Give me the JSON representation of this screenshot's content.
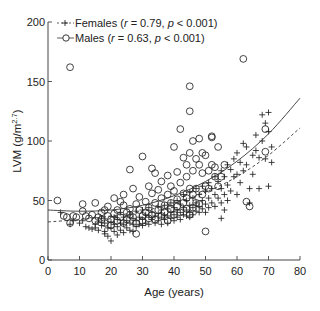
{
  "chart_data": {
    "type": "scatter",
    "title": "",
    "xlabel": "Age (years)",
    "ylabel": "LVM (g/m^2.7)",
    "ylabel_main": "LVM (g/m",
    "ylabel_sup": "2.7",
    "ylabel_end": ")",
    "xlim": [
      0,
      80
    ],
    "ylim": [
      0,
      200
    ],
    "xticks": [
      0,
      10,
      20,
      30,
      40,
      50,
      60,
      70,
      80
    ],
    "yticks": [
      0,
      50,
      100,
      150,
      200
    ],
    "grid": false,
    "legend_position": "top-left",
    "series": [
      {
        "name": "Females",
        "legend_label": "Females (r = 0.79, p < 0.001)",
        "marker": "plus",
        "line": "dashed",
        "r": "0.79",
        "p": "< 0.001",
        "fit_curve": {
          "x": [
            0,
            10,
            20,
            30,
            40,
            50,
            60,
            70,
            80
          ],
          "y": [
            32,
            34,
            37,
            41,
            48,
            57,
            70,
            88,
            111
          ]
        },
        "points": [
          [
            4,
            40
          ],
          [
            7,
            30
          ],
          [
            8,
            33
          ],
          [
            10,
            31
          ],
          [
            11,
            33
          ],
          [
            12,
            28
          ],
          [
            13,
            27
          ],
          [
            14,
            26
          ],
          [
            15,
            30
          ],
          [
            15,
            27
          ],
          [
            16,
            32
          ],
          [
            16,
            25
          ],
          [
            17,
            35
          ],
          [
            17,
            29
          ],
          [
            18,
            31
          ],
          [
            18,
            24
          ],
          [
            18,
            22
          ],
          [
            19,
            27
          ],
          [
            19,
            20
          ],
          [
            20,
            32
          ],
          [
            20,
            16
          ],
          [
            20,
            27
          ],
          [
            21,
            36
          ],
          [
            21,
            30
          ],
          [
            21,
            24
          ],
          [
            22,
            34
          ],
          [
            22,
            28
          ],
          [
            22,
            21
          ],
          [
            23,
            40
          ],
          [
            23,
            31
          ],
          [
            23,
            25
          ],
          [
            24,
            36
          ],
          [
            24,
            30
          ],
          [
            24,
            23
          ],
          [
            25,
            33
          ],
          [
            25,
            27
          ],
          [
            26,
            38
          ],
          [
            26,
            31
          ],
          [
            26,
            25
          ],
          [
            27,
            35
          ],
          [
            27,
            30
          ],
          [
            27,
            24
          ],
          [
            28,
            41
          ],
          [
            28,
            33
          ],
          [
            28,
            28
          ],
          [
            29,
            36
          ],
          [
            29,
            30
          ],
          [
            30,
            42
          ],
          [
            30,
            34
          ],
          [
            30,
            29
          ],
          [
            31,
            38
          ],
          [
            31,
            31
          ],
          [
            32,
            44
          ],
          [
            32,
            36
          ],
          [
            32,
            30
          ],
          [
            33,
            40
          ],
          [
            33,
            34
          ],
          [
            34,
            37
          ],
          [
            34,
            31
          ],
          [
            35,
            45
          ],
          [
            35,
            39
          ],
          [
            35,
            33
          ],
          [
            36,
            42
          ],
          [
            36,
            36
          ],
          [
            36,
            30
          ],
          [
            37,
            46
          ],
          [
            37,
            38
          ],
          [
            37,
            34
          ],
          [
            38,
            43
          ],
          [
            38,
            37
          ],
          [
            38,
            31
          ],
          [
            39,
            48
          ],
          [
            39,
            40
          ],
          [
            39,
            35
          ],
          [
            40,
            44
          ],
          [
            40,
            38
          ],
          [
            40,
            33
          ],
          [
            41,
            50
          ],
          [
            41,
            42
          ],
          [
            41,
            36
          ],
          [
            42,
            47
          ],
          [
            42,
            40
          ],
          [
            42,
            34
          ],
          [
            43,
            55
          ],
          [
            43,
            44
          ],
          [
            43,
            38
          ],
          [
            44,
            50
          ],
          [
            44,
            42
          ],
          [
            44,
            37
          ],
          [
            45,
            57
          ],
          [
            45,
            46
          ],
          [
            45,
            40
          ],
          [
            45,
            36
          ],
          [
            46,
            52
          ],
          [
            46,
            44
          ],
          [
            46,
            38
          ],
          [
            47,
            60
          ],
          [
            47,
            48
          ],
          [
            47,
            41
          ],
          [
            48,
            55
          ],
          [
            48,
            45
          ],
          [
            48,
            40
          ],
          [
            49,
            62
          ],
          [
            49,
            50
          ],
          [
            49,
            43
          ],
          [
            50,
            58
          ],
          [
            50,
            47
          ],
          [
            50,
            40
          ],
          [
            51,
            65
          ],
          [
            51,
            52
          ],
          [
            51,
            44
          ],
          [
            52,
            60
          ],
          [
            52,
            48
          ],
          [
            53,
            70
          ],
          [
            53,
            55
          ],
          [
            53,
            45
          ],
          [
            54,
            66
          ],
          [
            54,
            52
          ],
          [
            55,
            75
          ],
          [
            55,
            60
          ],
          [
            55,
            48
          ],
          [
            55,
            35
          ],
          [
            56,
            70
          ],
          [
            56,
            55
          ],
          [
            56,
            42
          ],
          [
            57,
            80
          ],
          [
            57,
            63
          ],
          [
            57,
            50
          ],
          [
            58,
            76
          ],
          [
            58,
            58
          ],
          [
            59,
            85
          ],
          [
            59,
            70
          ],
          [
            60,
            90
          ],
          [
            60,
            72
          ],
          [
            60,
            55
          ],
          [
            61,
            82
          ],
          [
            61,
            65
          ],
          [
            62,
            98
          ],
          [
            62,
            75
          ],
          [
            63,
            95
          ],
          [
            63,
            80
          ],
          [
            64,
            60
          ],
          [
            64,
            48
          ],
          [
            65,
            88
          ],
          [
            65,
            72
          ],
          [
            66,
            105
          ],
          [
            66,
            92
          ],
          [
            67,
            86
          ],
          [
            67,
            60
          ],
          [
            68,
            122
          ],
          [
            68,
            100
          ],
          [
            69,
            115
          ],
          [
            69,
            85
          ],
          [
            70,
            124
          ],
          [
            70,
            108
          ],
          [
            70,
            62
          ],
          [
            71,
            95
          ],
          [
            71,
            82
          ]
        ]
      },
      {
        "name": "Males",
        "legend_label": "Males (r = 0.63, p < 0.001)",
        "marker": "circle",
        "line": "solid",
        "r": "0.63",
        "p": "< 0.001",
        "fit_curve": {
          "x": [
            0,
            10,
            20,
            30,
            40,
            50,
            60,
            70,
            80
          ],
          "y": [
            42,
            41,
            42,
            46,
            54,
            66,
            83,
            106,
            136
          ]
        },
        "points": [
          [
            3,
            50
          ],
          [
            5,
            37
          ],
          [
            6,
            36
          ],
          [
            7,
            31
          ],
          [
            7,
            162
          ],
          [
            8,
            37
          ],
          [
            9,
            36
          ],
          [
            11,
            47
          ],
          [
            11,
            41
          ],
          [
            12,
            37
          ],
          [
            13,
            35
          ],
          [
            14,
            38
          ],
          [
            15,
            48
          ],
          [
            15,
            33
          ],
          [
            16,
            36
          ],
          [
            17,
            40
          ],
          [
            17,
            34
          ],
          [
            18,
            42
          ],
          [
            18,
            31
          ],
          [
            19,
            37
          ],
          [
            19,
            45
          ],
          [
            20,
            34
          ],
          [
            20,
            29
          ],
          [
            21,
            39
          ],
          [
            21,
            52
          ],
          [
            22,
            33
          ],
          [
            22,
            42
          ],
          [
            23,
            49
          ],
          [
            23,
            36
          ],
          [
            24,
            55
          ],
          [
            24,
            46
          ],
          [
            24,
            31
          ],
          [
            25,
            40
          ],
          [
            25,
            34
          ],
          [
            26,
            43
          ],
          [
            26,
            76
          ],
          [
            26,
            38
          ],
          [
            27,
            60
          ],
          [
            27,
            36
          ],
          [
            28,
            47
          ],
          [
            28,
            22
          ],
          [
            28,
            31
          ],
          [
            29,
            53
          ],
          [
            29,
            42
          ],
          [
            30,
            37
          ],
          [
            30,
            87
          ],
          [
            30,
            33
          ],
          [
            31,
            49
          ],
          [
            31,
            40
          ],
          [
            32,
            62
          ],
          [
            32,
            44
          ],
          [
            32,
            35
          ],
          [
            33,
            77
          ],
          [
            33,
            56
          ],
          [
            33,
            38
          ],
          [
            34,
            73
          ],
          [
            34,
            48
          ],
          [
            34,
            34
          ],
          [
            35,
            59
          ],
          [
            35,
            42
          ],
          [
            36,
            66
          ],
          [
            36,
            52
          ],
          [
            36,
            37
          ],
          [
            37,
            46
          ],
          [
            37,
            40
          ],
          [
            38,
            71
          ],
          [
            38,
            55
          ],
          [
            38,
            33
          ],
          [
            39,
            62
          ],
          [
            39,
            48
          ],
          [
            39,
            43
          ],
          [
            40,
            95
          ],
          [
            40,
            58
          ],
          [
            40,
            38
          ],
          [
            41,
            74
          ],
          [
            41,
            51
          ],
          [
            41,
            45
          ],
          [
            42,
            110
          ],
          [
            42,
            65
          ],
          [
            42,
            40
          ],
          [
            43,
            86
          ],
          [
            43,
            56
          ],
          [
            43,
            48
          ],
          [
            44,
            80
          ],
          [
            44,
            70
          ],
          [
            44,
            52
          ],
          [
            44,
            43
          ],
          [
            45,
            146
          ],
          [
            45,
            125
          ],
          [
            45,
            90
          ],
          [
            45,
            60
          ],
          [
            45,
            38
          ],
          [
            46,
            100
          ],
          [
            46,
            75
          ],
          [
            46,
            55
          ],
          [
            46,
            44
          ],
          [
            47,
            85
          ],
          [
            47,
            60
          ],
          [
            47,
            48
          ],
          [
            48,
            102
          ],
          [
            48,
            80
          ],
          [
            48,
            47
          ],
          [
            49,
            90
          ],
          [
            49,
            73
          ],
          [
            49,
            55
          ],
          [
            50,
            24
          ],
          [
            50,
            88
          ],
          [
            50,
            62
          ],
          [
            51,
            75
          ],
          [
            51,
            60
          ],
          [
            52,
            103
          ],
          [
            52,
            104
          ],
          [
            52,
            80
          ],
          [
            53,
            78
          ],
          [
            53,
            70
          ],
          [
            54,
            95
          ],
          [
            54,
            62
          ],
          [
            55,
            70
          ],
          [
            56,
            80
          ],
          [
            62,
            169
          ],
          [
            63,
            49
          ],
          [
            64,
            45
          ],
          [
            69,
            110
          ],
          [
            69,
            91
          ]
        ]
      }
    ]
  },
  "legend": {
    "females_prefix": "Females (",
    "females_r_label": "r",
    "females_r_value": " = 0.79, ",
    "females_p_label": "p",
    "females_p_value": " < 0.001)",
    "males_prefix": "Males (",
    "males_r_label": "r",
    "males_r_value": " = 0.63, ",
    "males_p_label": "p",
    "males_p_value": " < 0.001)"
  },
  "colors": {
    "axis": "#444444",
    "marker": "#222222",
    "background": "#ffffff"
  }
}
